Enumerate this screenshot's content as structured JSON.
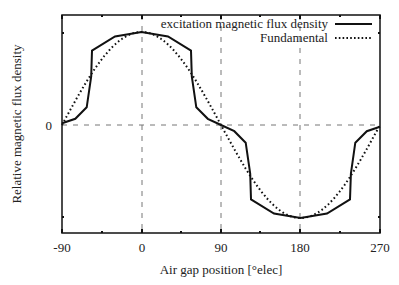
{
  "chart_data": {
    "type": "line",
    "title": "",
    "xlabel": "Air gap position [°elec]",
    "ylabel": "Relative magnetic flux density",
    "xlim": [
      -90,
      270
    ],
    "ylim": [
      -1.1,
      1.1
    ],
    "xticks": [
      "-90",
      "0",
      "90",
      "180",
      "270"
    ],
    "yticks": [
      "0"
    ],
    "grid": "dashed lines at x=0, 90, 180 and y=0",
    "legend_position": "upper right",
    "series": [
      {
        "name": "excitation magnetic flux density",
        "style": "solid",
        "x": [
          -90,
          -75,
          -62,
          -57,
          -56,
          -30,
          0,
          30,
          56,
          57,
          62,
          75,
          90,
          105,
          118,
          123,
          124,
          150,
          180,
          210,
          236,
          237,
          242,
          255,
          270
        ],
        "y": [
          0.02,
          0.07,
          0.2,
          0.55,
          0.84,
          1.0,
          1.05,
          1.0,
          0.84,
          0.55,
          0.2,
          0.07,
          0.0,
          -0.07,
          -0.2,
          -0.55,
          -0.84,
          -1.0,
          -1.05,
          -1.0,
          -0.84,
          -0.55,
          -0.2,
          -0.07,
          -0.02
        ]
      },
      {
        "name": "Fundamental",
        "style": "dotted",
        "x": [
          -90,
          -45,
          0,
          45,
          90,
          135,
          180,
          225,
          270
        ],
        "y": [
          0,
          0.74,
          1.05,
          0.74,
          0,
          -0.74,
          -1.05,
          -0.74,
          0
        ]
      }
    ]
  },
  "legend": {
    "entries": [
      "excitation magnetic flux density",
      "Fundamental"
    ]
  }
}
